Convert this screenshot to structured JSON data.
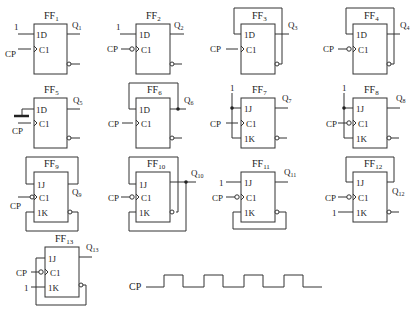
{
  "figure": {
    "type": "flip-flop circuit exercise",
    "flip_flops": [
      {
        "id": "FF1",
        "name": "FF",
        "sub": "1",
        "type": "D",
        "inputs": {
          "D": "1"
        },
        "clock": "CP",
        "clock_edge": "rising",
        "output": "Q",
        "out_sub": "1",
        "feedback": "none"
      },
      {
        "id": "FF2",
        "name": "FF",
        "sub": "2",
        "type": "D",
        "inputs": {
          "D": "1"
        },
        "clock": "CP",
        "clock_edge": "falling",
        "output": "Q",
        "out_sub": "2",
        "feedback": "none"
      },
      {
        "id": "FF3",
        "name": "FF",
        "sub": "3",
        "type": "D",
        "inputs": {
          "D": "Qbar"
        },
        "clock": "CP",
        "clock_edge": "rising",
        "output": "Q",
        "out_sub": "3",
        "feedback": "Qbar to 1D"
      },
      {
        "id": "FF4",
        "name": "FF",
        "sub": "4",
        "type": "D",
        "inputs": {
          "D": "Qbar"
        },
        "clock": "CP",
        "clock_edge": "falling",
        "output": "Q",
        "out_sub": "4",
        "feedback": "Qbar to 1D"
      },
      {
        "id": "FF5",
        "name": "FF",
        "sub": "5",
        "type": "D",
        "inputs": {
          "D": "ground (0)"
        },
        "clock": "CP",
        "clock_edge": "rising",
        "output": "Q",
        "out_sub": "5",
        "feedback": "none"
      },
      {
        "id": "FF6",
        "name": "FF",
        "sub": "6",
        "type": "D",
        "inputs": {
          "D": "Q"
        },
        "clock": "CP",
        "clock_edge": "rising",
        "output": "Q",
        "out_sub": "6",
        "feedback": "Q to 1D"
      },
      {
        "id": "FF7",
        "name": "FF",
        "sub": "7",
        "type": "JK",
        "inputs": {
          "J": "1",
          "K": "1"
        },
        "clock": "CP",
        "clock_edge": "rising",
        "output": "Q",
        "out_sub": "7",
        "feedback": "none"
      },
      {
        "id": "FF8",
        "name": "FF",
        "sub": "8",
        "type": "JK",
        "inputs": {
          "J": "1",
          "K": "1"
        },
        "clock": "CP",
        "clock_edge": "falling",
        "output": "Q",
        "out_sub": "8",
        "feedback": "none"
      },
      {
        "id": "FF9",
        "name": "FF",
        "sub": "9",
        "type": "JK",
        "inputs": {
          "J": "Q",
          "K": "Qbar"
        },
        "clock": "CP",
        "clock_edge": "falling",
        "output": "Q",
        "out_sub": "9",
        "feedback": "Q to 1J, Qbar to 1K"
      },
      {
        "id": "FF10",
        "name": "FF",
        "sub": "10",
        "type": "JK",
        "inputs": {
          "J": "Qbar",
          "K": "Q"
        },
        "clock": "CP",
        "clock_edge": "falling",
        "output": "Q",
        "out_sub": "10",
        "feedback": "Qbar to 1J, Q to 1K"
      },
      {
        "id": "FF11",
        "name": "FF",
        "sub": "11",
        "type": "JK",
        "inputs": {
          "J": "1",
          "K": "Qbar"
        },
        "clock": "CP",
        "clock_edge": "falling",
        "output": "Q",
        "out_sub": "11",
        "feedback": "Qbar to 1K"
      },
      {
        "id": "FF12",
        "name": "FF",
        "sub": "12",
        "type": "JK",
        "inputs": {
          "J": "Q",
          "K": "1"
        },
        "clock": "CP",
        "clock_edge": "falling",
        "output": "Q",
        "out_sub": "12",
        "feedback": "Q to 1J"
      },
      {
        "id": "FF13",
        "name": "FF",
        "sub": "13",
        "type": "JK",
        "inputs": {
          "J": "Qbar",
          "K": "1"
        },
        "clock": "CP",
        "clock_edge": "falling",
        "output": "Q",
        "out_sub": "13",
        "feedback": "Qbar to 1J"
      }
    ],
    "pin_labels": {
      "d": "1D",
      "j": "1J",
      "k": "1K",
      "c": "C1"
    },
    "const_one": "1",
    "clock_label": "CP",
    "waveform": {
      "label": "CP",
      "pulses": 4
    }
  }
}
